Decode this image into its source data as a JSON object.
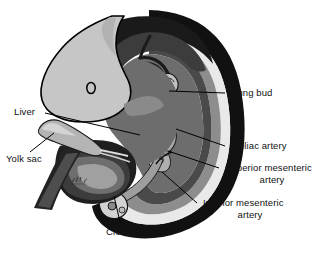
{
  "figure": {
    "type": "anatomical-illustration",
    "background_color": "#ffffff"
  },
  "palette": {
    "outline": "#000000",
    "head_gray": "#c6c6c6",
    "amnion_black": "#111111",
    "amnion_white": "#e8e8e8",
    "mid_gray": "#8d8d8d",
    "dark_gray": "#4a4a4a",
    "deep_gray": "#2b2b2b",
    "organ_gray": "#9a9a9a",
    "yolk_gray": "#b4b4b4",
    "label_color": "#111111"
  },
  "labels": [
    {
      "id": "lung-bud",
      "text": "Lung bud",
      "lines": [
        "Lung bud"
      ],
      "side": "right",
      "x": 232,
      "y": 87
    },
    {
      "id": "celiac-artery",
      "text": "Celiac artery",
      "lines": [
        "Celiac artery"
      ],
      "side": "right",
      "x": 232,
      "y": 140
    },
    {
      "id": "superior-mesenteric-artery",
      "text": "Superior mesenteric artery",
      "lines": [
        "Superior mesenteric",
        "artery"
      ],
      "side": "right",
      "x": 225,
      "y": 162
    },
    {
      "id": "inferior-mesenteric-artery",
      "text": "Inferior mesenteric artery",
      "lines": [
        "Inferior mesenteric",
        "artery"
      ],
      "side": "right",
      "x": 203,
      "y": 197
    },
    {
      "id": "liver",
      "text": "Liver",
      "lines": [
        "Liver"
      ],
      "side": "left",
      "x": 14,
      "y": 106
    },
    {
      "id": "yolk-sac",
      "text": "Yolk sac",
      "lines": [
        "Yolk sac"
      ],
      "side": "left",
      "x": 6,
      "y": 153
    },
    {
      "id": "cloaca",
      "text": "Cloaca",
      "lines": [
        "Cloaca"
      ],
      "side": "bottom",
      "x": 106,
      "y": 226
    }
  ],
  "structures": [
    {
      "id": "head",
      "name": "embryonic head"
    },
    {
      "id": "otic-vesicle",
      "name": "otic vesicle"
    },
    {
      "id": "amnion",
      "name": "amniotic / body wall layers"
    },
    {
      "id": "liver-mass",
      "name": "liver"
    },
    {
      "id": "heart-aorta",
      "name": "heart and dorsal aorta"
    },
    {
      "id": "lung-bud-structure",
      "name": "lung bud"
    },
    {
      "id": "gut-loop",
      "name": "midgut loop"
    },
    {
      "id": "cloaca-structure",
      "name": "cloaca"
    },
    {
      "id": "yolk-sac-structure",
      "name": "yolk sac"
    },
    {
      "id": "vitelline-stalk",
      "name": "vitelline stalk"
    }
  ]
}
